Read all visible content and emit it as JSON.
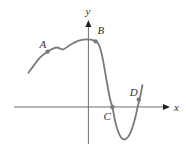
{
  "chart_data": {
    "type": "line",
    "title": "",
    "xlabel": "x",
    "ylabel": "y",
    "grid": false,
    "legend": "none",
    "xlim": [
      -6.2,
      6.8
    ],
    "ylim": [
      -3.0,
      6.8
    ],
    "series": [
      {
        "name": "f(x)",
        "color": "#7a7a7a",
        "points": [
          [
            -5.0,
            2.5
          ],
          [
            -4.5,
            3.1
          ],
          [
            -4.0,
            3.65
          ],
          [
            -3.4,
            4.05
          ],
          [
            -3.0,
            4.25
          ],
          [
            -2.6,
            4.35
          ],
          [
            -2.1,
            4.22
          ],
          [
            -1.5,
            4.55
          ],
          [
            -0.8,
            4.85
          ],
          [
            0.0,
            4.95
          ],
          [
            0.6,
            4.8
          ],
          [
            0.9,
            4.5
          ],
          [
            1.2,
            3.5
          ],
          [
            1.5,
            2.0
          ],
          [
            1.8,
            0.6
          ],
          [
            2.0,
            0.0
          ],
          [
            2.3,
            -1.3
          ],
          [
            2.7,
            -2.2
          ],
          [
            3.1,
            -2.35
          ],
          [
            3.5,
            -1.9
          ],
          [
            3.9,
            -0.8
          ],
          [
            4.1,
            0.0
          ],
          [
            4.3,
            0.7
          ],
          [
            4.5,
            1.6
          ]
        ]
      }
    ],
    "labeled_points": [
      {
        "label": "A",
        "x": -3.4,
        "y": 4.05
      },
      {
        "label": "B",
        "x": 0.6,
        "y": 4.8
      },
      {
        "label": "C",
        "x": 2.0,
        "y": 0.0
      },
      {
        "label": "D",
        "x": 4.2,
        "y": 0.55
      }
    ],
    "axes": {
      "x_label": "x",
      "y_label": "y"
    }
  }
}
